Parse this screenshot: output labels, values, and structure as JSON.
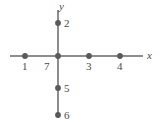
{
  "figure": {
    "width": 162,
    "height": 123,
    "background": "#ffffff",
    "axis_color": "#8d8d8d",
    "dot_color": "#59595b",
    "label_color": "#4a4a4c"
  },
  "axes": {
    "x_axis": {
      "label": "x",
      "label_x": 147,
      "label_y": 50,
      "line_x1": 10,
      "line_x2": 143,
      "line_y": 56
    },
    "y_axis": {
      "label": "y",
      "label_x": 59,
      "label_y": 1,
      "line_x": 58,
      "line_y1": 10,
      "line_y2": 118
    }
  },
  "origin": {
    "x": 58,
    "y": 56
  },
  "chart_data": {
    "type": "scatter",
    "xlabel": "x",
    "ylabel": "y",
    "grid": false,
    "legend": false,
    "points": [
      {
        "label": "1",
        "px": 25,
        "py": 56,
        "axis": "x",
        "label_px": 22,
        "label_py": 61
      },
      {
        "label": "7",
        "px": 58,
        "py": 56,
        "axis": "origin",
        "label_px": 44,
        "label_py": 61
      },
      {
        "label": "3",
        "px": 89,
        "py": 56,
        "axis": "x",
        "label_px": 86,
        "label_py": 61
      },
      {
        "label": "4",
        "px": 120,
        "py": 56,
        "axis": "x",
        "label_px": 117,
        "label_py": 61
      },
      {
        "label": "2",
        "px": 58,
        "py": 23,
        "axis": "y",
        "label_px": 64,
        "label_py": 18
      },
      {
        "label": "5",
        "px": 58,
        "py": 88,
        "axis": "y",
        "label_px": 64,
        "label_py": 83
      },
      {
        "label": "6",
        "px": 58,
        "py": 115,
        "axis": "y",
        "label_px": 64,
        "label_py": 110
      }
    ],
    "dot_radius": 2.9
  }
}
